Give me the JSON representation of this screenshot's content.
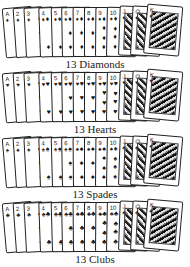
{
  "groups": [
    {
      "label": "13 Diamonds",
      "suit": "diamonds",
      "symbol": "♦"
    },
    {
      "label": "13 Hearts",
      "suit": "hearts",
      "symbol": "♥"
    },
    {
      "label": "13 Spades",
      "suit": "spades",
      "symbol": "♠"
    },
    {
      "label": "13 Clubs",
      "suit": "clubs",
      "symbol": "♣"
    }
  ],
  "ranks": [
    "A",
    "2",
    "3",
    "4",
    "5",
    "6",
    "7",
    "8",
    "9",
    "10",
    "J",
    "Q",
    "K"
  ],
  "colors": {
    "ink": "#222222",
    "background": "#ffffff"
  }
}
